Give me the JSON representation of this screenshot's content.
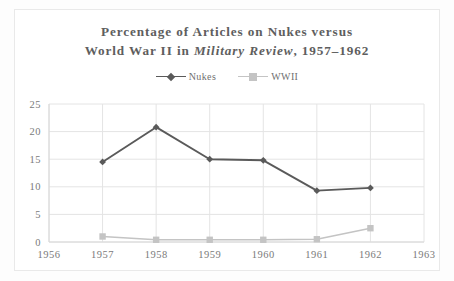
{
  "title": {
    "line1": "Percentage of Articles on Nukes versus",
    "line2_before": "World War II in ",
    "line2_italic": "Military Review",
    "line2_after": ", 1957–1962"
  },
  "legend": {
    "position": "top-center",
    "entries": [
      {
        "label": "Nukes",
        "color": "#5a5a5a",
        "marker": "diamond"
      },
      {
        "label": "WWII",
        "color": "#c4c4c4",
        "marker": "square"
      }
    ]
  },
  "chart_data": {
    "type": "line",
    "title": "Percentage of Articles on Nukes versus World War II in Military Review, 1957–1962",
    "xlabel": "",
    "ylabel": "",
    "x": [
      1957,
      1958,
      1959,
      1960,
      1961,
      1962
    ],
    "xlim": [
      1956,
      1963
    ],
    "ylim": [
      0,
      25
    ],
    "xticks": [
      "1956",
      "1957",
      "1958",
      "1959",
      "1960",
      "1961",
      "1962",
      "1963"
    ],
    "yticks": [
      "0",
      "5",
      "10",
      "15",
      "20",
      "25"
    ],
    "grid": true,
    "series": [
      {
        "name": "Nukes",
        "color": "#5a5a5a",
        "marker": "diamond",
        "values": [
          14.5,
          20.8,
          15.0,
          14.8,
          9.3,
          9.8
        ]
      },
      {
        "name": "WWII",
        "color": "#c4c4c4",
        "marker": "square",
        "values": [
          1.0,
          0.4,
          0.4,
          0.4,
          0.5,
          2.5
        ]
      }
    ]
  }
}
